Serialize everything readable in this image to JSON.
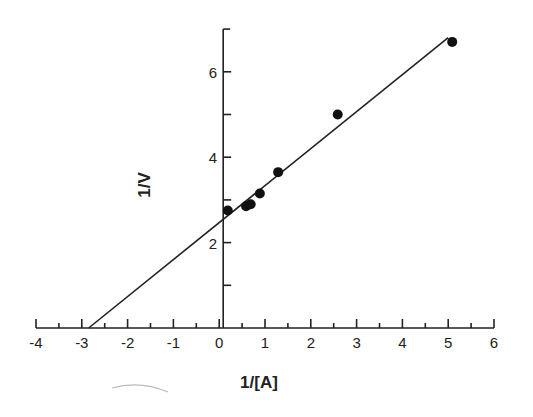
{
  "chart_data": {
    "type": "scatter",
    "title": "",
    "xlabel": "1/[A]",
    "ylabel": "1/V",
    "xlim": [
      -4,
      6
    ],
    "ylim": [
      0,
      7
    ],
    "grid": false,
    "legend": null,
    "x_ticks": [
      "-4",
      "-3",
      "-2",
      "-1",
      "0",
      "1",
      "2",
      "3",
      "4",
      "5",
      "6"
    ],
    "y_ticks": [
      "2",
      "4",
      "6"
    ],
    "series": [
      {
        "name": "data",
        "x": [
          0.1,
          0.5,
          0.6,
          0.8,
          1.2,
          2.5,
          5.0
        ],
        "y": [
          2.75,
          2.85,
          2.9,
          3.15,
          3.65,
          5.0,
          6.7
        ]
      }
    ],
    "fit_line": {
      "x": [
        -2.85,
        5.0
      ],
      "y": [
        0.0,
        6.8
      ]
    }
  }
}
